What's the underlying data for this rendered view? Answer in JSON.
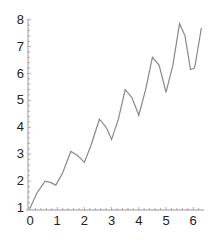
{
  "chart_data": {
    "type": "line",
    "title": "",
    "xlabel": "",
    "ylabel": "",
    "xlim": [
      0,
      6.3
    ],
    "ylim": [
      1,
      8
    ],
    "grid": false,
    "legend": null,
    "x_ticks": [
      "0",
      "1",
      "2",
      "3",
      "4",
      "5",
      "6"
    ],
    "y_ticks": [
      "1",
      "2",
      "3",
      "4",
      "5",
      "6",
      "7",
      "8"
    ],
    "series": [
      {
        "name": "curve",
        "color": "#888888",
        "x": [
          0,
          0.25,
          0.55,
          0.75,
          0.95,
          1.2,
          1.5,
          1.75,
          2.0,
          2.25,
          2.55,
          2.8,
          3.0,
          3.25,
          3.5,
          3.75,
          4.0,
          4.25,
          4.5,
          4.75,
          5.0,
          5.25,
          5.5,
          5.7,
          5.9,
          6.05,
          6.3
        ],
        "y": [
          1.0,
          1.55,
          2.0,
          1.95,
          1.85,
          2.3,
          3.1,
          2.95,
          2.7,
          3.35,
          4.3,
          4.0,
          3.55,
          4.3,
          5.4,
          5.1,
          4.45,
          5.4,
          6.6,
          6.3,
          5.3,
          6.3,
          7.85,
          7.4,
          6.15,
          6.2,
          7.7
        ]
      }
    ]
  }
}
